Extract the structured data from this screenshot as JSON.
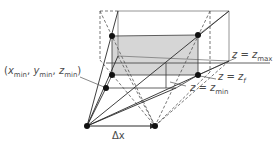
{
  "diagram": {
    "labels": {
      "corner": {
        "prefix": "(",
        "x": "x",
        "x_sub": "min",
        "y": "y",
        "y_sub": "min",
        "z": "z",
        "z_sub": "min",
        "suffix": ")"
      },
      "zmax": {
        "lhs": "z",
        "eq": " = ",
        "rhs": "z",
        "sub": "max"
      },
      "zf": {
        "lhs": "z",
        "eq": " = ",
        "rhs": "z",
        "sub": "f"
      },
      "zmin": {
        "lhs": "z",
        "eq": " = ",
        "rhs": "z",
        "sub": "min"
      },
      "dx": "Δx"
    },
    "colors": {
      "line": "#2a2a2a",
      "light_line": "#7a7a7a",
      "plane_fill": "#d6d6d6",
      "label": "#4a4a4a"
    }
  }
}
